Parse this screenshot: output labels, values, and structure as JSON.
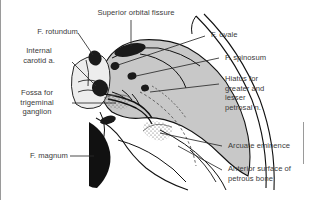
{
  "figure": {
    "colors": {
      "background": "#ffffff",
      "bone_fill": "#c8c8c8",
      "bone_fill_light": "#ededed",
      "foramen_fill": "#1a1a1a",
      "outline": "#111111",
      "leader_line": "#2a2a2a",
      "text": "#3b3b3b",
      "frame": "#9a9a9a"
    },
    "labels": [
      {
        "id": "f-rotundum",
        "text": "F. rotundum"
      },
      {
        "id": "superior-orbital-fissure",
        "text": "Superior orbital fissure"
      },
      {
        "id": "f-ovale",
        "text": "F. ovale"
      },
      {
        "id": "internal-carotid-a",
        "text": "Internal\ncarotid a."
      },
      {
        "id": "f-spinosum",
        "text": "F. spinosum"
      },
      {
        "id": "fossa-trigeminal-ganglion",
        "text": "Fossa for\ntrigeminal\nganglion"
      },
      {
        "id": "hiatus-petrosal",
        "text": "Hiatus for\ngreater and\nlesser\npetrosal n."
      },
      {
        "id": "arcuate-eminence",
        "text": "Arcuate eminence"
      },
      {
        "id": "f-magnum",
        "text": "F. magnum"
      },
      {
        "id": "anterior-surface-petrous",
        "text": "Anterior surface of\npetrous bone"
      }
    ]
  }
}
